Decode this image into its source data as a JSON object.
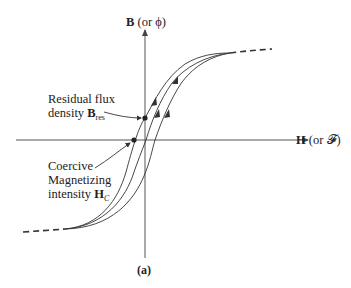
{
  "axes": {
    "y_label_bold": "B",
    "y_label_rest": "(or ϕ)",
    "x_label_bold": "H",
    "x_label_rest": "(or 𝓕)"
  },
  "annotations": {
    "residual": {
      "line1": "Residual flux",
      "line2_text": "density ",
      "line2_bold": "B",
      "line2_sub": "res"
    },
    "coercive": {
      "line1": "Coercive",
      "line2": "Magnetizing",
      "line3_text": "intensity ",
      "line3_bold": "H",
      "line3_sub": "C"
    }
  },
  "caption": "(a)",
  "colors": {
    "line": "#333333",
    "axis": "#555555"
  }
}
